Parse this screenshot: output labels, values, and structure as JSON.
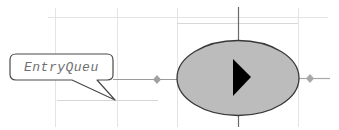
{
  "diagram": {
    "callout": {
      "label": "EntryQueu"
    },
    "node": {
      "shape": "ellipse",
      "icon": "play-icon",
      "fill": "#bcbcbc",
      "stroke": "#3a3a3a"
    },
    "connectors": {
      "left": {
        "marker": "diamond",
        "color": "#9a9a9a"
      },
      "right": {
        "marker": "diamond",
        "color": "#9a9a9a"
      }
    },
    "grid": {
      "color": "#e2e2e2"
    }
  }
}
